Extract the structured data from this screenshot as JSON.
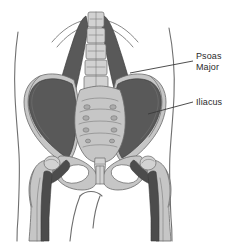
{
  "figure": {
    "name": "psoas-major-iliacus-anatomy",
    "background_color": "#ffffff",
    "view": "anterior view of pelvis, lumbar spine and proximal femurs",
    "width": 236,
    "height": 244
  },
  "palette": {
    "background": "#ffffff",
    "muscle_dark": "#595959",
    "muscle_darker": "#4c4c4c",
    "bone": "#c6c6c6",
    "bone_light": "#d2d2d2",
    "bone_outline": "#6a6a6a",
    "body_outline": "#6f6f6f",
    "label_text": "#2b2b2b",
    "leader_line": "#3a3a3a"
  },
  "labels": [
    {
      "id": "psoas-major",
      "lines": [
        "Psoas",
        "Major"
      ],
      "line1": "Psoas",
      "line2": "Major",
      "text_x": 196,
      "text_y": 59,
      "leader_from_x": 193,
      "leader_from_y": 61,
      "leader_to_x": 130,
      "leader_to_y": 73,
      "points_to": "psoas major muscle, right side"
    },
    {
      "id": "iliacus",
      "lines": [
        "Iliacus"
      ],
      "line1": "Iliacus",
      "line2": "",
      "text_x": 196,
      "text_y": 105,
      "leader_from_x": 193,
      "leader_from_y": 102,
      "leader_to_x": 148,
      "leader_to_y": 114,
      "points_to": "iliacus muscle, right iliac fossa"
    }
  ],
  "anatomy": {
    "structures": [
      {
        "id": "lumbar-spine",
        "label": "lumbar vertebral column",
        "vertebra_count": 5
      },
      {
        "id": "ribs",
        "label": "lower rib arcs",
        "count": 4
      },
      {
        "id": "sacrum",
        "label": "sacrum",
        "foramina": 8
      },
      {
        "id": "ilium-left",
        "label": "left ilium wing"
      },
      {
        "id": "ilium-right",
        "label": "right ilium wing"
      },
      {
        "id": "obturator-foramen-left",
        "label": "left obturator foramen"
      },
      {
        "id": "obturator-foramen-right",
        "label": "right obturator foramen"
      },
      {
        "id": "pubic-symphysis",
        "label": "pubic symphysis"
      },
      {
        "id": "femur-left",
        "label": "left femur with greater trochanter"
      },
      {
        "id": "femur-right",
        "label": "right femur with greater trochanter"
      },
      {
        "id": "psoas-major-left",
        "label": "left psoas major muscle"
      },
      {
        "id": "psoas-major-right",
        "label": "right psoas major muscle"
      },
      {
        "id": "iliacus-left",
        "label": "left iliacus muscle"
      },
      {
        "id": "iliacus-right",
        "label": "right iliacus muscle"
      },
      {
        "id": "body-outline",
        "label": "torso and thigh silhouette"
      }
    ]
  }
}
